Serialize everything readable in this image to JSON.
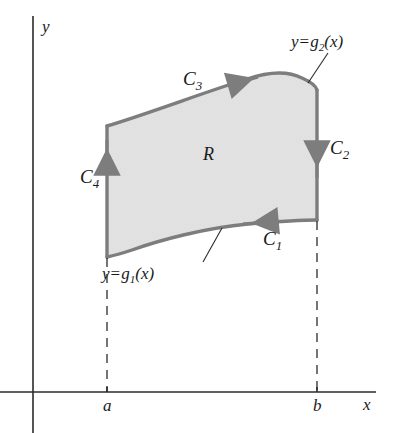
{
  "figure": {
    "kind": "green-theorem-region-diagram",
    "region_label": "R",
    "axes": {
      "y_axis_label": "y",
      "x_axis_label": "x",
      "x_tick_labels": [
        "a",
        "b"
      ],
      "axis_color": "#2b2b2b"
    },
    "curves": [
      {
        "id": "C1",
        "label": "C",
        "subscript": "1",
        "direction": "right",
        "description": "lower boundary curve"
      },
      {
        "id": "C2",
        "label": "C",
        "subscript": "2",
        "direction": "up",
        "description": "right vertical edge"
      },
      {
        "id": "C3",
        "label": "C",
        "subscript": "3",
        "direction": "left",
        "description": "upper boundary curve"
      },
      {
        "id": "C4",
        "label": "C",
        "subscript": "4",
        "direction": "down",
        "description": "left vertical edge"
      }
    ],
    "functions": [
      {
        "id": "g2",
        "lhs": "y",
        "eq": "=",
        "rhs_base": "g",
        "rhs_sub": "2",
        "rhs_arg": "(x)",
        "text": "y = g2(x)",
        "description": "upper boundary function"
      },
      {
        "id": "g1",
        "lhs": "y",
        "eq": "=",
        "rhs_base": "g",
        "rhs_sub": "1",
        "rhs_arg": "(x)",
        "text": "y = g1(x)",
        "description": "lower boundary function"
      }
    ],
    "colors": {
      "region_fill": "#e2e2e2",
      "boundary_stroke": "#7d7d7d",
      "axis": "#2b2b2b",
      "dashed_guide": "#2b2b2b",
      "text": "#1a1a1a"
    }
  }
}
